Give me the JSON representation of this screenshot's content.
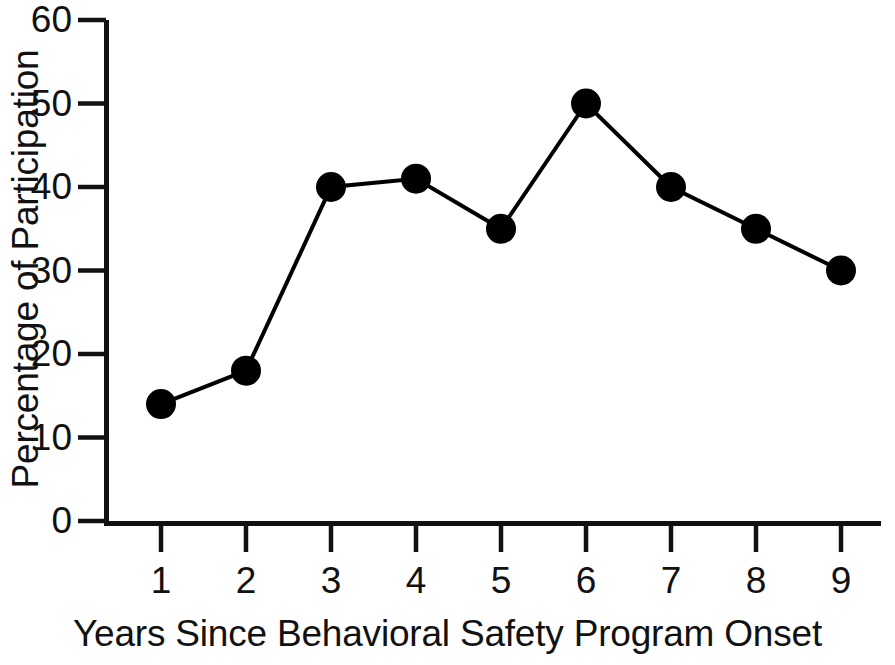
{
  "chart_data": {
    "type": "line",
    "title": "",
    "xlabel": "Years Since Behavioral Safety Program Onset",
    "ylabel": "Percentage of Participation",
    "x": [
      1,
      2,
      3,
      4,
      5,
      6,
      7,
      8,
      9
    ],
    "values": [
      14,
      18,
      40,
      41,
      35,
      50,
      40,
      35,
      30
    ],
    "categories": [
      "1",
      "2",
      "3",
      "4",
      "5",
      "6",
      "7",
      "8",
      "9"
    ],
    "xlim": [
      0.5,
      9.5
    ],
    "ylim": [
      0,
      60
    ],
    "x_tick_labels": [
      "1",
      "2",
      "3",
      "4",
      "5",
      "6",
      "7",
      "8",
      "9"
    ],
    "y_tick_labels": [
      "0",
      "10",
      "20",
      "30",
      "40",
      "50",
      "60"
    ],
    "y_ticks": [
      0,
      10,
      20,
      30,
      40,
      50,
      60
    ],
    "grid": false,
    "legend": false,
    "legend_position": "none",
    "marker": "filled-circle",
    "marker_color": "#000000",
    "line_color": "#000000",
    "background_color": "#ffffff",
    "axis_color": "#000000"
  }
}
